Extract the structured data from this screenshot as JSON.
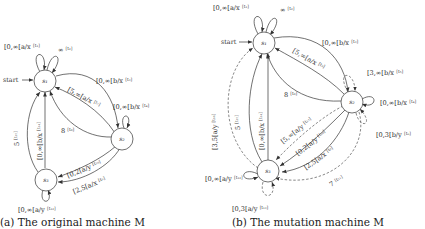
{
  "figure_a": {
    "caption": "(a) The original machine M",
    "start_label": "start",
    "nodes": [
      {
        "id": "s1",
        "label": "s₁"
      },
      {
        "id": "s2",
        "label": "s₂"
      },
      {
        "id": "s3",
        "label": "s₃"
      }
    ],
    "edges": [
      {
        "id": "t1",
        "from": "s1",
        "to": "s1",
        "label": "[0,∞[a/x",
        "sup": "[t₁]"
      },
      {
        "id": "t2",
        "from": "s1",
        "to": "s1",
        "label": "∞",
        "sup": "[t₂]"
      },
      {
        "id": "t3",
        "from": "s1",
        "to": "s2",
        "label": "[0,∞[b/x",
        "sup": "[t₃]"
      },
      {
        "id": "t4",
        "from": "s2",
        "to": "s2",
        "label": "[0,∞[b/x",
        "sup": "[t₄]"
      },
      {
        "id": "t7",
        "from": "s2",
        "to": "s1",
        "label": "[5,∞[a/x",
        "sup": "[t₇]"
      },
      {
        "id": "t8",
        "from": "s2",
        "to": "s1",
        "label": "8",
        "sup": "[t₈]"
      },
      {
        "id": "t10",
        "from": "s2",
        "to": "s3",
        "label": "[0,2[a/y",
        "sup": "[t₁₀]"
      },
      {
        "id": "t9",
        "from": "s2",
        "to": "s3",
        "label": "[2,5[a/x",
        "sup": "[t₉]"
      },
      {
        "id": "t14",
        "from": "s3",
        "to": "s1",
        "label": "[0,∞[b/x",
        "sup": "[t₁₄]"
      },
      {
        "id": "t15",
        "from": "s3",
        "to": "s1",
        "label": "5",
        "sup": "[t₁₅]"
      },
      {
        "id": "t12",
        "from": "s3",
        "to": "s3",
        "label": "[0,∞[a/y",
        "sup": "[t₁₂]"
      }
    ]
  },
  "figure_b": {
    "caption": "(b) The mutation machine M",
    "start_label": "start",
    "nodes": [
      {
        "id": "s1",
        "label": "s₁"
      },
      {
        "id": "s2",
        "label": "s₂"
      },
      {
        "id": "s3",
        "label": "s₃"
      }
    ],
    "edges": [
      {
        "id": "t1",
        "label": "[0,∞[a/x",
        "sup": "[t₁]",
        "style": "solid"
      },
      {
        "id": "t2",
        "label": "∞",
        "sup": "[t₂]",
        "style": "solid"
      },
      {
        "id": "t3",
        "label": "[0,∞[b/x",
        "sup": "[t₃]",
        "style": "solid"
      },
      {
        "id": "t7",
        "label": "[5,∞[a/x",
        "sup": "[t₇]",
        "style": "solid"
      },
      {
        "id": "t8",
        "label": "8",
        "sup": "[t₈]",
        "style": "solid"
      },
      {
        "id": "t5",
        "label": "[3,∞[b/x",
        "sup": "[t₅]",
        "style": "dashed"
      },
      {
        "id": "t4",
        "label": "[0,∞[b/x",
        "sup": "[t₄]",
        "style": "solid"
      },
      {
        "id": "t6",
        "label": "[0,3[b/y",
        "sup": "[t₆]",
        "style": "dashed"
      },
      {
        "id": "t17",
        "label": "[5,∞[a/y",
        "sup": "[t₁₇]",
        "style": "dashed"
      },
      {
        "id": "t10",
        "label": "[0,2[a/y",
        "sup": "[t₁₀]",
        "style": "solid"
      },
      {
        "id": "t9",
        "label": "[2,5[a/x",
        "sup": "[t₉]",
        "style": "solid"
      },
      {
        "id": "t11",
        "label": "7",
        "sup": "[t₁₁]",
        "style": "dashed"
      },
      {
        "id": "t16",
        "label": "[3,5[a/y",
        "sup": "[t₁₆]",
        "style": "dashed"
      },
      {
        "id": "t15",
        "label": "5",
        "sup": "[t₁₅]",
        "style": "solid"
      },
      {
        "id": "t14",
        "label": "[0,∞[b/x",
        "sup": "[t₁₄]",
        "style": "solid"
      },
      {
        "id": "t12",
        "label": "[0,∞[a/y",
        "sup": "[t₁₂]",
        "style": "solid"
      },
      {
        "id": "t13",
        "label": "[0,3[a/y",
        "sup": "[t₁₃]",
        "style": "dashed"
      }
    ]
  }
}
